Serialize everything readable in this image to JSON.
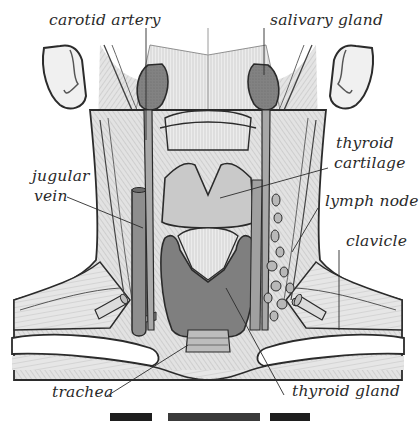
{
  "diagram": {
    "colors": {
      "background": "#ffffff",
      "outline": "#2b2b2b",
      "skin_light": "#e9e9e9",
      "muscle_mid": "#cfcfcf",
      "cartilage": "#c4c4c4",
      "gland_dark": "#8c8c8c",
      "thyroid_dark": "#7d7d7d",
      "vessel": "#9a9a9a",
      "label_text": "#2a2a2a"
    },
    "labels": [
      {
        "id": "carotid-artery",
        "text": "carotid artery"
      },
      {
        "id": "salivary-gland",
        "text": "salivary gland"
      },
      {
        "id": "thyroid-cartilage-line1",
        "text": "thyroid"
      },
      {
        "id": "thyroid-cartilage-line2",
        "text": "cartilage"
      },
      {
        "id": "jugular-vein-line1",
        "text": "jugular"
      },
      {
        "id": "jugular-vein-line2",
        "text": "vein"
      },
      {
        "id": "lymph-node",
        "text": "lymph node"
      },
      {
        "id": "clavicle",
        "text": "clavicle"
      },
      {
        "id": "trachea",
        "text": "trachea"
      },
      {
        "id": "thyroid-gland",
        "text": "thyroid gland"
      }
    ],
    "caption": {
      "visible": "truncated at bottom edge (only tops of capital letters visible)"
    }
  }
}
